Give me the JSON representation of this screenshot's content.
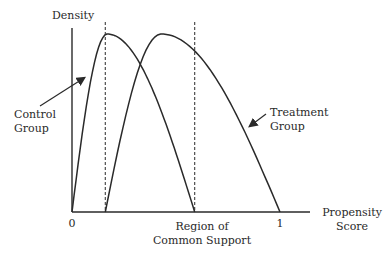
{
  "chart_data": {
    "type": "line",
    "title": "",
    "ylabel": "Density",
    "xlabel": "Propensity Score",
    "xlabel_lines": [
      "Propensity",
      "Score"
    ],
    "x_ticks": [
      {
        "value": 0,
        "label": "0"
      },
      {
        "value": 1,
        "label": "1"
      }
    ],
    "xlim": [
      0,
      1.2
    ],
    "ylim": [
      0,
      1.05
    ],
    "series": [
      {
        "name": "Control Group",
        "label_lines": [
          "Control",
          "Group"
        ],
        "support": [
          0,
          0.59
        ],
        "peak": 0.17,
        "peak_density": 1.0
      },
      {
        "name": "Treatment Group",
        "label_lines": [
          "Treatment",
          "Group"
        ],
        "support": [
          0.16,
          1.0
        ],
        "peak": 0.43,
        "peak_density": 1.0
      }
    ],
    "region": {
      "label_lines": [
        "Region of",
        "Common Support"
      ],
      "bounds": [
        0.16,
        0.59
      ]
    }
  }
}
